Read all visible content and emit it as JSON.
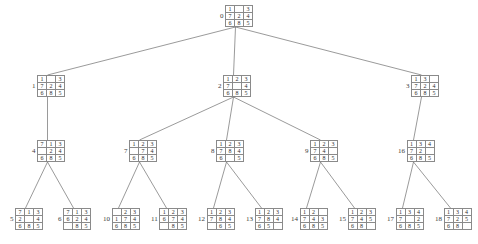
{
  "figure": {
    "board_rows": 3,
    "board_cols": 3,
    "blank_symbol": "",
    "line_color": "#6f6f6f",
    "cell_border_color": "#8a8a8a",
    "text_color": "#2e2e2e",
    "background": "#ffffff"
  },
  "nodes": [
    {
      "id": "0",
      "x": 220,
      "y": 5,
      "depth": 0,
      "board": [
        "1",
        "",
        "3",
        "7",
        "2",
        "4",
        "6",
        "8",
        "5"
      ]
    },
    {
      "id": "1",
      "x": 32,
      "y": 75,
      "depth": 1,
      "board": [
        "1",
        "",
        "3",
        "7",
        "2",
        "4",
        "6",
        "8",
        "5"
      ]
    },
    {
      "id": "2",
      "x": 218,
      "y": 75,
      "depth": 1,
      "board": [
        "1",
        "2",
        "3",
        "7",
        "",
        "4",
        "6",
        "8",
        "5"
      ]
    },
    {
      "id": "3",
      "x": 406,
      "y": 75,
      "depth": 1,
      "board": [
        "1",
        "3",
        "",
        "7",
        "2",
        "4",
        "6",
        "8",
        "5"
      ]
    },
    {
      "id": "4",
      "x": 32,
      "y": 140,
      "depth": 2,
      "board": [
        "7",
        "1",
        "3",
        "",
        "2",
        "4",
        "6",
        "8",
        "5"
      ]
    },
    {
      "id": "7",
      "x": 124,
      "y": 140,
      "depth": 2,
      "board": [
        "1",
        "2",
        "3",
        "",
        "7",
        "4",
        "6",
        "8",
        "5"
      ]
    },
    {
      "id": "8",
      "x": 211,
      "y": 140,
      "depth": 2,
      "board": [
        "1",
        "2",
        "3",
        "7",
        "8",
        "4",
        "6",
        "",
        "5"
      ]
    },
    {
      "id": "9",
      "x": 305,
      "y": 140,
      "depth": 2,
      "board": [
        "1",
        "2",
        "3",
        "7",
        "4",
        "",
        "6",
        "8",
        "5"
      ]
    },
    {
      "id": "16",
      "x": 398,
      "y": 140,
      "depth": 2,
      "board": [
        "1",
        "3",
        "4",
        "7",
        "2",
        "",
        "6",
        "8",
        "5"
      ]
    },
    {
      "id": "5",
      "x": 10,
      "y": 208,
      "depth": 3,
      "board": [
        "7",
        "1",
        "3",
        "2",
        "",
        "4",
        "6",
        "8",
        "5"
      ]
    },
    {
      "id": "6",
      "x": 58,
      "y": 208,
      "depth": 3,
      "board": [
        "7",
        "1",
        "3",
        "6",
        "2",
        "4",
        "",
        "8",
        "5"
      ]
    },
    {
      "id": "10",
      "x": 103,
      "y": 208,
      "depth": 3,
      "board": [
        "",
        "2",
        "3",
        "1",
        "7",
        "4",
        "6",
        "8",
        "5"
      ]
    },
    {
      "id": "11",
      "x": 151,
      "y": 208,
      "depth": 3,
      "board": [
        "1",
        "2",
        "3",
        "6",
        "7",
        "4",
        "",
        "8",
        "5"
      ]
    },
    {
      "id": "12",
      "x": 198,
      "y": 208,
      "depth": 3,
      "board": [
        "1",
        "2",
        "3",
        "7",
        "8",
        "4",
        "",
        "6",
        "5"
      ]
    },
    {
      "id": "13",
      "x": 246,
      "y": 208,
      "depth": 3,
      "board": [
        "1",
        "2",
        "3",
        "7",
        "8",
        "4",
        "6",
        "5",
        ""
      ]
    },
    {
      "id": "14",
      "x": 291,
      "y": 208,
      "depth": 3,
      "board": [
        "1",
        "2",
        "",
        "7",
        "4",
        "3",
        "6",
        "8",
        "5"
      ]
    },
    {
      "id": "15",
      "x": 339,
      "y": 208,
      "depth": 3,
      "board": [
        "1",
        "2",
        "3",
        "7",
        "4",
        "5",
        "6",
        "8",
        ""
      ]
    },
    {
      "id": "17",
      "x": 387,
      "y": 208,
      "depth": 3,
      "board": [
        "1",
        "3",
        "4",
        "7",
        "",
        "2",
        "6",
        "8",
        "5"
      ]
    },
    {
      "id": "18",
      "x": 435,
      "y": 208,
      "depth": 3,
      "board": [
        "1",
        "3",
        "4",
        "7",
        "2",
        "5",
        "6",
        "8",
        ""
      ]
    }
  ],
  "edges": [
    {
      "from": "0",
      "to": "1"
    },
    {
      "from": "0",
      "to": "2"
    },
    {
      "from": "0",
      "to": "3"
    },
    {
      "from": "1",
      "to": "4"
    },
    {
      "from": "2",
      "to": "7"
    },
    {
      "from": "2",
      "to": "8"
    },
    {
      "from": "2",
      "to": "9"
    },
    {
      "from": "3",
      "to": "16"
    },
    {
      "from": "4",
      "to": "5"
    },
    {
      "from": "4",
      "to": "6"
    },
    {
      "from": "7",
      "to": "10"
    },
    {
      "from": "7",
      "to": "11"
    },
    {
      "from": "8",
      "to": "12"
    },
    {
      "from": "8",
      "to": "13"
    },
    {
      "from": "9",
      "to": "14"
    },
    {
      "from": "9",
      "to": "15"
    },
    {
      "from": "16",
      "to": "17"
    },
    {
      "from": "16",
      "to": "18"
    }
  ]
}
